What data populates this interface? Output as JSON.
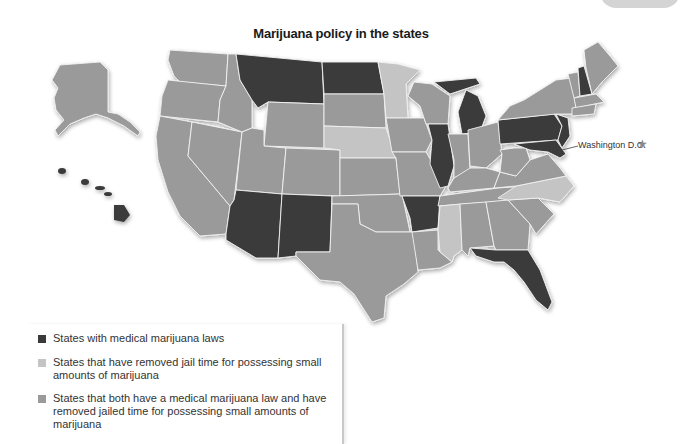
{
  "title": "Marijuana policy in the states",
  "annotation": {
    "dc_label": "Washington D.C.",
    "dc_icon": "star-icon"
  },
  "colors": {
    "medical": "#3a3a3a",
    "decriminalized": "#c4c4c4",
    "both": "#9a9a9a",
    "none": "#9a9a9a",
    "border": "#f2f2f2"
  },
  "legend": {
    "items": [
      {
        "label": "States with medical marijuana laws",
        "color": "#3a3a3a"
      },
      {
        "label": "States that have removed jail time for possessing small amounts of marijuana",
        "color": "#c4c4c4"
      },
      {
        "label": "States that both have a medical marijuana law and have removed jailed time for possessing small amounts of marijuana",
        "color": "#9a9a9a"
      }
    ]
  },
  "map": {
    "medical_states": [
      "Montana",
      "North Dakota",
      "Arizona",
      "New Mexico",
      "Arkansas",
      "Illinois",
      "Michigan",
      "Florida",
      "Pennsylvania",
      "New Jersey",
      "New Hampshire",
      "Maryland",
      "Delaware",
      "Hawaii"
    ],
    "decriminalized_states": [
      "Minnesota",
      "Nebraska",
      "Mississippi",
      "North Carolina"
    ]
  }
}
